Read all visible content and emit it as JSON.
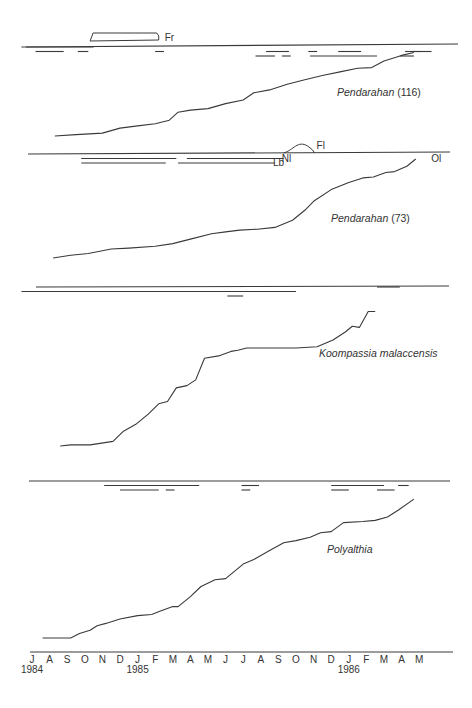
{
  "chart_data": {
    "type": "line",
    "title": "",
    "xlabel": "",
    "ylabel": "",
    "x_axis": {
      "months": [
        "J",
        "A",
        "S",
        "O",
        "N",
        "D",
        "J",
        "F",
        "M",
        "A",
        "M",
        "J",
        "J",
        "A",
        "S",
        "O",
        "N",
        "D",
        "J",
        "F",
        "M",
        "A",
        "M"
      ],
      "years": [
        {
          "label": "1984",
          "month_index": 0
        },
        {
          "label": "1985",
          "month_index": 6
        },
        {
          "label": "1986",
          "month_index": 18
        }
      ],
      "range": [
        0,
        22
      ]
    },
    "panels": [
      {
        "name": "Pendarahan (116)",
        "label_parts": {
          "italic": "Pendarahan",
          "suffix": " (116)"
        },
        "series": {
          "x": [
            1.3,
            2.5,
            4,
            5,
            6,
            7,
            7.8,
            8.3,
            9,
            10,
            11,
            12,
            12.6,
            13.5,
            14.5,
            15.5,
            16.5,
            17.5,
            18.5,
            19.3,
            20,
            21,
            21.7
          ],
          "y": [
            0.0,
            0.02,
            0.04,
            0.11,
            0.14,
            0.17,
            0.22,
            0.33,
            0.36,
            0.38,
            0.45,
            0.5,
            0.6,
            0.64,
            0.72,
            0.78,
            0.84,
            0.89,
            0.94,
            0.95,
            1.04,
            1.12,
            1.16
          ]
        },
        "annotations": [
          {
            "label": "Fr",
            "type": "fruiting-box",
            "start": 3.3,
            "end": 7.2
          }
        ],
        "phenology_bars": [
          {
            "row": 0,
            "start": -0.6,
            "end": 3.5
          },
          {
            "row": 1,
            "start": 0.2,
            "end": 1.8
          },
          {
            "row": 1,
            "start": 2.6,
            "end": 3.2
          },
          {
            "row": 1,
            "start": 7.0,
            "end": 7.5
          },
          {
            "row": 1,
            "start": 13.3,
            "end": 14.6
          },
          {
            "row": 2,
            "start": 12.7,
            "end": 13.8
          },
          {
            "row": 2,
            "start": 14.2,
            "end": 14.7
          },
          {
            "row": 1,
            "start": 15.7,
            "end": 16.2
          },
          {
            "row": 2,
            "start": 15.8,
            "end": 19.6
          },
          {
            "row": 1,
            "start": 17.4,
            "end": 18.7
          },
          {
            "row": 1,
            "start": 21.2,
            "end": 22.7
          },
          {
            "row": 2,
            "start": 20.9,
            "end": 21.7
          },
          {
            "row": 1,
            "start": 21.6,
            "end": 22.1,
            "thick": true
          }
        ]
      },
      {
        "name": "Pendarahan (73)",
        "label_parts": {
          "italic": "Pendarahan",
          "suffix": " (73)"
        },
        "series": {
          "x": [
            1.2,
            2.2,
            3.2,
            4.5,
            5.5,
            7,
            8,
            9,
            10.2,
            11,
            11.8,
            12.8,
            13.8,
            14.8,
            15.5,
            16,
            17,
            18,
            18.8,
            19.4,
            20.1,
            20.6,
            21.3,
            21.8
          ],
          "y": [
            0.0,
            0.03,
            0.05,
            0.1,
            0.11,
            0.13,
            0.16,
            0.21,
            0.27,
            0.29,
            0.31,
            0.32,
            0.34,
            0.42,
            0.53,
            0.63,
            0.76,
            0.84,
            0.89,
            0.9,
            0.95,
            0.96,
            1.02,
            1.1
          ]
        },
        "annotations": [
          {
            "label": "Nl",
            "type": "text",
            "at": 14.3
          },
          {
            "label": "Lb",
            "type": "text",
            "at": 13.8
          },
          {
            "label": "Fl",
            "type": "flowering-arc",
            "start": 14.3,
            "end": 16.0
          },
          {
            "label": "Ol",
            "type": "text",
            "at": 22.4
          }
        ],
        "phenology_bars": [
          {
            "row": 1,
            "start": 2.8,
            "end": 8.2
          },
          {
            "row": 2,
            "start": 2.8,
            "end": 7.6
          },
          {
            "row": 1,
            "start": 8.8,
            "end": 14.3
          },
          {
            "row": 2,
            "start": 8.3,
            "end": 13.8
          }
        ]
      },
      {
        "name": "Koompassia malaccensis",
        "label_parts": {
          "italic": "Koompassia malaccensis",
          "suffix": ""
        },
        "series": {
          "x": [
            1.6,
            2.2,
            3.3,
            4.6,
            5.2,
            5.9,
            6.6,
            7.2,
            7.7,
            8.2,
            8.8,
            9.3,
            9.8,
            10.6,
            11.3,
            11.7,
            12.2,
            13.5,
            15.0,
            16.2,
            17.1,
            17.8,
            18.2,
            18.6,
            19.1,
            19.5
          ],
          "y": [
            0.0,
            0.01,
            0.01,
            0.04,
            0.13,
            0.19,
            0.28,
            0.37,
            0.39,
            0.51,
            0.53,
            0.58,
            0.77,
            0.79,
            0.83,
            0.84,
            0.86,
            0.86,
            0.86,
            0.87,
            0.93,
            1.0,
            1.05,
            1.04,
            1.18,
            1.18
          ]
        },
        "annotations": [],
        "phenology_bars": [
          {
            "row": 1,
            "start": -0.6,
            "end": 14.8
          },
          {
            "row": 1,
            "start": 11.9,
            "end": 15.0
          },
          {
            "row": 2,
            "start": 11.1,
            "end": 12.0
          },
          {
            "row": 0,
            "start": 19.6,
            "end": 20.9
          }
        ]
      },
      {
        "name": "Polyalthia",
        "label_parts": {
          "italic": "Polyalthia",
          "suffix": ""
        },
        "series": {
          "x": [
            0.6,
            1.5,
            2.2,
            2.7,
            3.3,
            3.7,
            4.2,
            5,
            6,
            6.8,
            7.3,
            8,
            8.3,
            9,
            9.6,
            10.4,
            11,
            12,
            12.6,
            13.5,
            14.3,
            15,
            15.8,
            16.4,
            17,
            17.7,
            18.8,
            19.5,
            20.2,
            20.8,
            21.7
          ],
          "y": [
            0.0,
            0.0,
            0.0,
            0.04,
            0.07,
            0.11,
            0.13,
            0.17,
            0.2,
            0.21,
            0.24,
            0.28,
            0.28,
            0.37,
            0.46,
            0.52,
            0.53,
            0.66,
            0.7,
            0.78,
            0.85,
            0.87,
            0.9,
            0.94,
            0.95,
            1.03,
            1.04,
            1.05,
            1.08,
            1.14,
            1.24
          ]
        },
        "annotations": [],
        "phenology_bars": [
          {
            "row": 1,
            "start": 4.1,
            "end": 9.5
          },
          {
            "row": 2,
            "start": 5.0,
            "end": 7.2
          },
          {
            "row": 2,
            "start": 7.6,
            "end": 8.1
          },
          {
            "row": 1,
            "start": 11.9,
            "end": 12.9
          },
          {
            "row": 2,
            "start": 11.9,
            "end": 12.4
          },
          {
            "row": 1,
            "start": 17.0,
            "end": 20.0
          },
          {
            "row": 2,
            "start": 17.0,
            "end": 18.0
          },
          {
            "row": 2,
            "start": 19.6,
            "end": 20.6
          },
          {
            "row": 1,
            "start": 20.8,
            "end": 21.4
          }
        ]
      }
    ]
  }
}
